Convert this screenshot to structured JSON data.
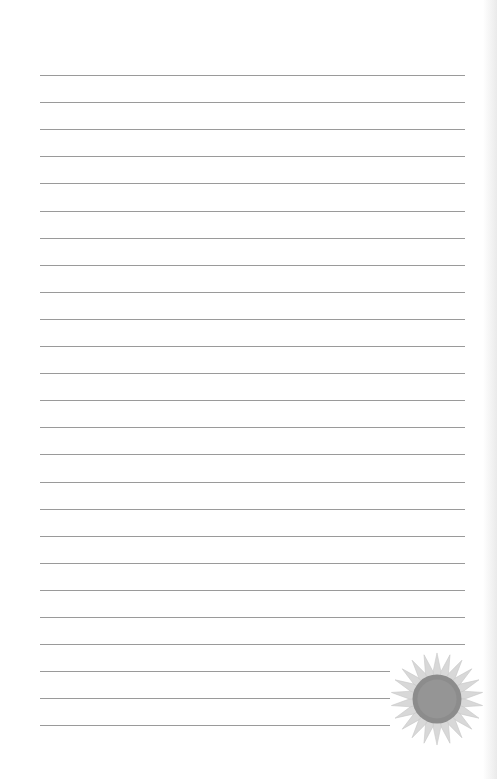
{
  "page": {
    "type": "lined-notebook-page",
    "background_color": "#ffffff",
    "rule_color": "#9a9a9a",
    "rules": {
      "count": 25,
      "left": 40,
      "right": 465,
      "first_y": 75,
      "spacing": 27.1,
      "short_rules_from_index": 22,
      "short_rule_right": 390
    },
    "decoration": {
      "icon": "sunflower-icon",
      "petal_color": "#d8d8d8",
      "center_color": "#8a8a8a"
    }
  }
}
